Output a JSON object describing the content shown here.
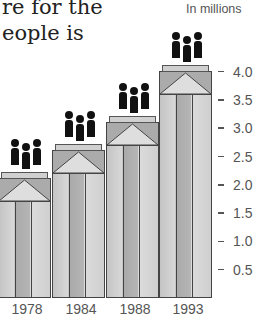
{
  "headline": {
    "line1": "re for the",
    "line2": "eople is"
  },
  "chart_data": {
    "type": "bar",
    "title": "",
    "unit_label": "In millions",
    "categories": [
      "1978",
      "1984",
      "1988",
      "1993"
    ],
    "values": [
      2.1,
      2.6,
      3.1,
      4.0
    ],
    "xlabel": "",
    "ylabel": "In millions",
    "ylim": [
      0,
      4.0
    ],
    "yticks": [
      "4.0",
      "3.5",
      "3.0",
      "2.5",
      "2.0",
      "1.5",
      "1.0",
      "0.5"
    ],
    "y_axis_position": "right",
    "grid": false,
    "decoration": "pictogram of three people atop each bar"
  },
  "colors": {
    "text": "#555555",
    "bar_dark": "#a9a9a9",
    "bar_light": "#dcdcdc",
    "figure": "#111111"
  }
}
